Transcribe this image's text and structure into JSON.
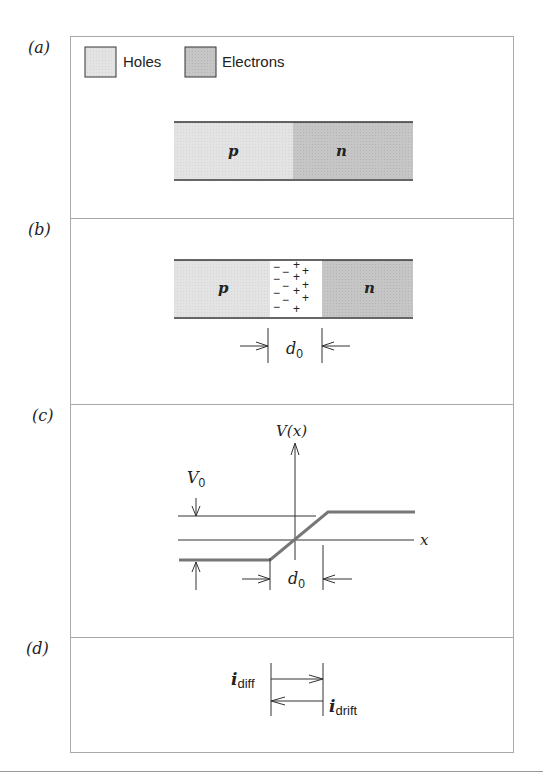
{
  "panels": {
    "a": {
      "label": "(a)",
      "legend": [
        {
          "name": "Holes",
          "color": "#e3e3e3"
        },
        {
          "name": "Electrons",
          "color": "#c4c4c4"
        }
      ],
      "p_label": "p",
      "n_label": "n"
    },
    "b": {
      "label": "(b)",
      "p_label": "p",
      "n_label": "n",
      "depletion_left_charges": "−",
      "depletion_right_charges": "+",
      "width_label": "d",
      "width_subscript": "0"
    },
    "c": {
      "label": "(c)",
      "y_axis": "V(x)",
      "x_axis": "x",
      "barrier_label": "V",
      "barrier_subscript": "0",
      "width_label": "d",
      "width_subscript": "0"
    },
    "d": {
      "label": "(d)",
      "current1": "i",
      "current1_sub": "diff",
      "current2": "i",
      "current2_sub": "drift"
    }
  },
  "colors": {
    "holes": "#e3e3e3",
    "electrons": "#c4c4c4",
    "frame": "#a9a9a9",
    "curve": "#777777"
  }
}
